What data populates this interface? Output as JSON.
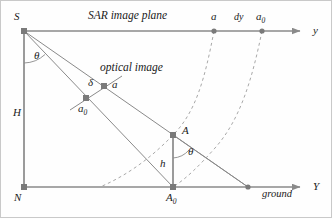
{
  "figure": {
    "colors": {
      "line": "#8a8a8a",
      "dash": "#a8a8a8",
      "node": "#6e6e6e",
      "text": "#1a1a1a",
      "background": "#fefefe",
      "border": "#c9c9c9"
    }
  },
  "labels": {
    "sar_plane": "SAR image plane",
    "optical_image": "optical image",
    "ground": "ground",
    "sensor": "S",
    "nadir": "N",
    "height": "H",
    "target_height": "h",
    "theta_top": "θ",
    "theta_bottom": "θ",
    "delta": "δ",
    "point_a_optical": "a",
    "point_a0_optical": "a",
    "point_a0_optical_sub": "0",
    "point_a_axis": "a",
    "point_a0_axis": "a",
    "point_a0_axis_sub": "0",
    "dy": "dy",
    "axis_y_top": "y",
    "axis_y_bottom": "Y",
    "point_A": "A",
    "point_A0": "A",
    "point_A0_sub": "0"
  },
  "geometry": {
    "S": [
      24,
      31
    ],
    "N": [
      24,
      187
    ],
    "A": [
      173,
      135
    ],
    "A0": [
      173,
      187
    ],
    "a_optical": [
      104,
      86
    ],
    "a0_optical": [
      86,
      98
    ],
    "a_axis": [
      214,
      31
    ],
    "a0_axis": [
      262,
      31
    ],
    "ground_point": [
      248,
      187
    ],
    "y_axis_end": [
      305,
      31
    ],
    "Y_axis_end": [
      305,
      187
    ],
    "ray_a_end": [
      248,
      187
    ],
    "optical_segment": [
      [
        70,
        110
      ],
      [
        122,
        76
      ]
    ],
    "arc_left": "M214,31 C205,78 196,112 173,135 C152,157 128,175 100,187",
    "arc_right": "M262,31 C252,80 240,120 215,148 C199,166 187,178 173,187"
  }
}
